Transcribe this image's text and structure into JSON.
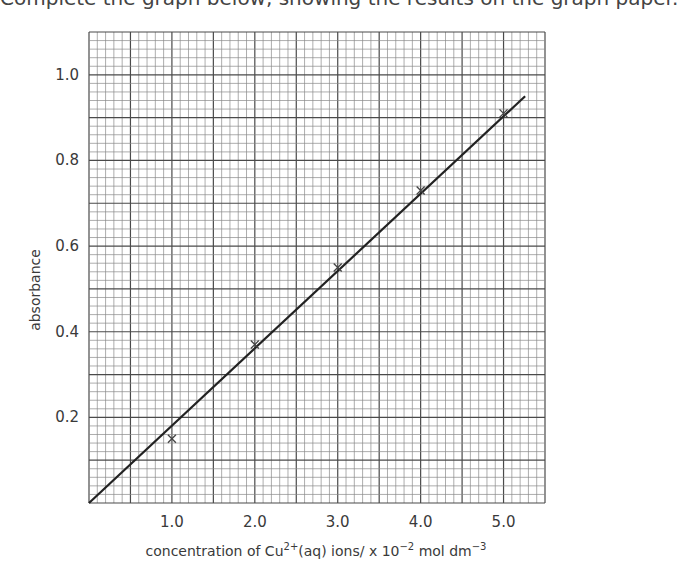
{
  "header": {
    "cropped_title": "Complete the graph below, showing the results on the graph paper."
  },
  "chart_data": {
    "type": "scatter",
    "title": "",
    "xlabel": "concentration of Cu²⁺(aq) ions/ x 10⁻² mol dm⁻³",
    "xlabel_parts": {
      "pre": "concentration of Cu",
      "sup1": "2+",
      "mid": "(aq) ions/ x 10",
      "sup2": "−2",
      "mid2": " mol dm",
      "sup3": "−3"
    },
    "ylabel": "absorbance",
    "xlim": [
      0,
      5.5
    ],
    "ylim": [
      0,
      1.1
    ],
    "x_ticks": [
      1.0,
      2.0,
      3.0,
      4.0,
      5.0
    ],
    "x_tick_labels": [
      "1.0",
      "2.0",
      "3.0",
      "4.0",
      "5.0"
    ],
    "y_ticks": [
      0.2,
      0.4,
      0.6,
      0.8,
      1.0
    ],
    "y_tick_labels": [
      "0.2",
      "0.4",
      "0.6",
      "0.8",
      "1.0"
    ],
    "grid": true,
    "grid_minor_x": 0.1,
    "grid_minor_y": 0.02,
    "grid_major_every": 5,
    "series": [
      {
        "name": "measured points",
        "marker": "x",
        "x": [
          1.0,
          2.0,
          3.0,
          4.0,
          5.0
        ],
        "y": [
          0.15,
          0.37,
          0.55,
          0.73,
          0.91
        ]
      },
      {
        "name": "best-fit line",
        "type": "line",
        "x": [
          0.0,
          5.26
        ],
        "y": [
          0.0,
          0.95
        ]
      }
    ],
    "legend": "none"
  },
  "style": {
    "minor_grid_color": "#8a8a8a",
    "major_grid_color": "#4a4a4a",
    "line_color": "#222222",
    "marker_color": "#444444"
  }
}
